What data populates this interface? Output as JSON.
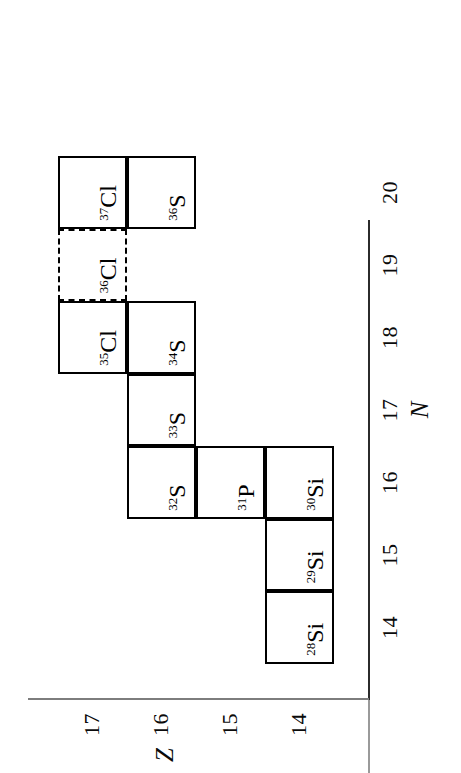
{
  "figure": {
    "kind": "nuclide-chart",
    "orientation": "rotated-90-ccw",
    "background_color": "#ffffff",
    "line_color": "#000000",
    "axis_color": "#3a3a3a"
  },
  "axes": {
    "x": {
      "title": "N",
      "ticks": [
        "14",
        "15",
        "16",
        "17",
        "18",
        "19",
        "20"
      ],
      "range": [
        13.5,
        20.5
      ]
    },
    "y": {
      "title": "Z",
      "ticks": [
        "14",
        "15",
        "16",
        "17"
      ],
      "range": [
        13.5,
        17.5
      ]
    }
  },
  "chart_data": {
    "type": "table",
    "title": "",
    "xlabel": "N",
    "ylabel": "Z",
    "xlim": [
      13.5,
      20.5
    ],
    "ylim": [
      13.5,
      17.5
    ],
    "x_ticks": [
      14,
      15,
      16,
      17,
      18,
      19,
      20
    ],
    "y_ticks": [
      14,
      15,
      16,
      17
    ],
    "grid": false,
    "legend": "none",
    "cells": [
      {
        "id": "si-28",
        "mass": "28",
        "symbol": "Si",
        "N": 14,
        "Z": 14,
        "style": "solid"
      },
      {
        "id": "si-29",
        "mass": "29",
        "symbol": "Si",
        "N": 15,
        "Z": 14,
        "style": "solid"
      },
      {
        "id": "si-30",
        "mass": "30",
        "symbol": "Si",
        "N": 16,
        "Z": 14,
        "style": "solid"
      },
      {
        "id": "p-31",
        "mass": "31",
        "symbol": "P",
        "N": 16,
        "Z": 15,
        "style": "solid"
      },
      {
        "id": "s-32",
        "mass": "32",
        "symbol": "S",
        "N": 16,
        "Z": 16,
        "style": "solid"
      },
      {
        "id": "s-33",
        "mass": "33",
        "symbol": "S",
        "N": 17,
        "Z": 16,
        "style": "solid"
      },
      {
        "id": "s-34",
        "mass": "34",
        "symbol": "S",
        "N": 18,
        "Z": 16,
        "style": "solid"
      },
      {
        "id": "s-36",
        "mass": "36",
        "symbol": "S",
        "N": 20,
        "Z": 16,
        "style": "solid"
      },
      {
        "id": "cl-35",
        "mass": "35",
        "symbol": "Cl",
        "N": 18,
        "Z": 17,
        "style": "solid"
      },
      {
        "id": "cl-36",
        "mass": "36",
        "symbol": "Cl",
        "N": 19,
        "Z": 17,
        "style": "dashed"
      },
      {
        "id": "cl-37",
        "mass": "37",
        "symbol": "Cl",
        "N": 20,
        "Z": 17,
        "style": "solid"
      }
    ]
  }
}
